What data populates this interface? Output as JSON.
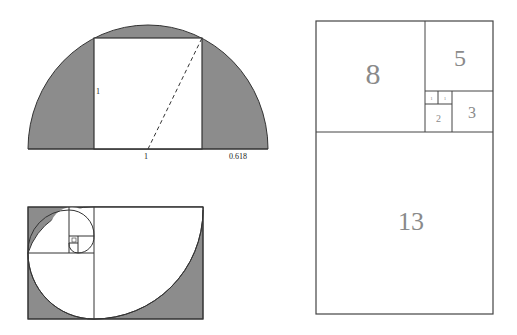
{
  "semicircle_figure": {
    "labels": {
      "side": "1",
      "base": "1",
      "extension": "0.618"
    }
  },
  "spiral_figure": {},
  "fibonacci_rectangle": {
    "squares": [
      {
        "label": "8"
      },
      {
        "label": "5"
      },
      {
        "label": "3"
      },
      {
        "label": "2"
      },
      {
        "label": "1"
      },
      {
        "label": "1"
      },
      {
        "label": "13"
      }
    ]
  },
  "colors": {
    "shade": "#8c8c8c",
    "line": "#444444",
    "number_text": "#8a8a8a"
  }
}
